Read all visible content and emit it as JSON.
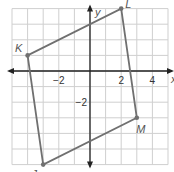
{
  "chart_data": {
    "type": "scatter",
    "title": "",
    "xlabel": "x",
    "ylabel": "y",
    "xlim": [
      -5,
      5
    ],
    "ylim": [
      -6,
      4
    ],
    "grid": true,
    "x_ticks": [
      {
        "value": -2,
        "label": "−2"
      },
      {
        "value": 2,
        "label": "2"
      },
      {
        "value": 4,
        "label": "4"
      }
    ],
    "y_ticks": [
      {
        "value": -2,
        "label": "−2"
      }
    ],
    "polygon": {
      "name": "JKLM",
      "vertices": [
        {
          "label": "K",
          "x": -4,
          "y": 1
        },
        {
          "label": "L",
          "x": 2,
          "y": 4
        },
        {
          "label": "M",
          "x": 3,
          "y": -3
        },
        {
          "label": "J",
          "x": -3,
          "y": -6
        }
      ],
      "color": "#707070"
    }
  }
}
